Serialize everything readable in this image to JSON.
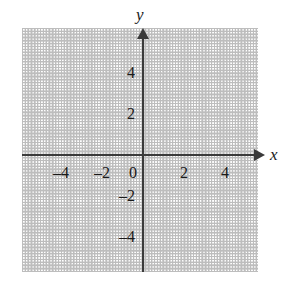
{
  "figure": {
    "title": "",
    "background_color": "#ffffff",
    "axis_color": "#3a3a3a",
    "grid_color": "#c9c9c9",
    "label_color": "#1a1a1a"
  },
  "axis_labels": {
    "x": "x",
    "y": "y"
  },
  "origin_label": "0",
  "chart_data": {
    "type": "scatter",
    "title": "",
    "xlabel": "x",
    "ylabel": "y",
    "xlim": [
      -5.9,
      5.5
    ],
    "ylim": [
      -5.7,
      6.0
    ],
    "grid": true,
    "grid_style": "dotted",
    "grid_minor_step": 0.5,
    "grid_major_step": 2,
    "legend": "none",
    "series": [],
    "x_ticks": [
      {
        "value": -4,
        "label": "–4"
      },
      {
        "value": -2,
        "label": "–2"
      },
      {
        "value": 0,
        "label": "0"
      },
      {
        "value": 2,
        "label": "2"
      },
      {
        "value": 4,
        "label": "4"
      }
    ],
    "y_ticks": [
      {
        "value": 4,
        "label": "4"
      },
      {
        "value": 2,
        "label": "2"
      },
      {
        "value": -2,
        "label": "–2"
      },
      {
        "value": -4,
        "label": "–4"
      }
    ],
    "annotations": []
  }
}
